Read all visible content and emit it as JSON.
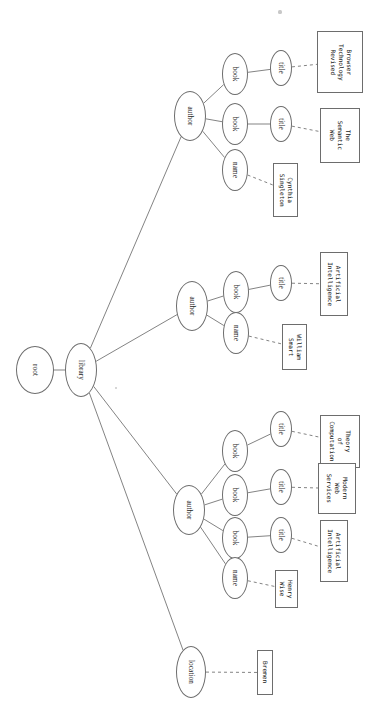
{
  "diagram": {
    "orientation": "rotated-90",
    "edge_color": "#6d6d6d",
    "node_fill": "#ffffff",
    "nodes": [
      {
        "id": "root",
        "label": "root",
        "cx": 35,
        "cy": 370,
        "rx": 19,
        "ry": 24
      },
      {
        "id": "library",
        "label": "library",
        "cx": 81,
        "cy": 370,
        "rx": 16,
        "ry": 27
      },
      {
        "id": "author1",
        "label": "author",
        "cx": 190,
        "cy": 116,
        "rx": 16,
        "ry": 25
      },
      {
        "id": "book1a",
        "label": "book",
        "cx": 235,
        "cy": 74,
        "rx": 13,
        "ry": 21
      },
      {
        "id": "title1a",
        "label": "title",
        "cx": 281,
        "cy": 68,
        "rx": 11,
        "ry": 18
      },
      {
        "id": "book1b",
        "label": "book",
        "cx": 235,
        "cy": 124,
        "rx": 13,
        "ry": 21
      },
      {
        "id": "title1b",
        "label": "title",
        "cx": 281,
        "cy": 124,
        "rx": 11,
        "ry": 18
      },
      {
        "id": "name1",
        "label": "name",
        "cx": 235,
        "cy": 170,
        "rx": 13,
        "ry": 21
      },
      {
        "id": "author2",
        "label": "author",
        "cx": 192,
        "cy": 306,
        "rx": 16,
        "ry": 25
      },
      {
        "id": "book2a",
        "label": "book",
        "cx": 236,
        "cy": 292,
        "rx": 13,
        "ry": 21
      },
      {
        "id": "title2a",
        "label": "title",
        "cx": 281,
        "cy": 283,
        "rx": 11,
        "ry": 18
      },
      {
        "id": "name2",
        "label": "name",
        "cx": 236,
        "cy": 333,
        "rx": 13,
        "ry": 21
      },
      {
        "id": "author3",
        "label": "author",
        "cx": 189,
        "cy": 510,
        "rx": 16,
        "ry": 25
      },
      {
        "id": "book3a",
        "label": "book",
        "cx": 235,
        "cy": 451,
        "rx": 13,
        "ry": 21
      },
      {
        "id": "title3a",
        "label": "title",
        "cx": 281,
        "cy": 429,
        "rx": 11,
        "ry": 18
      },
      {
        "id": "book3b",
        "label": "book",
        "cx": 235,
        "cy": 495,
        "rx": 13,
        "ry": 21
      },
      {
        "id": "title3b",
        "label": "title",
        "cx": 281,
        "cy": 487,
        "rx": 11,
        "ry": 18
      },
      {
        "id": "book3c",
        "label": "book",
        "cx": 235,
        "cy": 538,
        "rx": 13,
        "ry": 21
      },
      {
        "id": "title3c",
        "label": "title",
        "cx": 281,
        "cy": 535,
        "rx": 11,
        "ry": 18
      },
      {
        "id": "name3",
        "label": "name",
        "cx": 235,
        "cy": 578,
        "rx": 13,
        "ry": 21
      },
      {
        "id": "location",
        "label": "location",
        "cx": 191,
        "cy": 672,
        "rx": 15,
        "ry": 26
      }
    ],
    "leaves": [
      {
        "id": "leaf-browser-technology-revised",
        "text": "Browser\nTechnology\nRevised",
        "x": 317,
        "y": 31,
        "w": 46,
        "h": 62
      },
      {
        "id": "leaf-the-semantic-web",
        "text": "The\nSemantic\nWeb",
        "x": 320,
        "y": 108,
        "w": 40,
        "h": 55
      },
      {
        "id": "leaf-cynthia-singleton",
        "text": "Cynthia\nSingleton",
        "x": 273,
        "y": 163,
        "w": 25,
        "h": 54
      },
      {
        "id": "leaf-artificial-intelligence-1",
        "text": "Artificial\nIntelligence",
        "x": 320,
        "y": 252,
        "w": 28,
        "h": 64
      },
      {
        "id": "leaf-william-smart",
        "text": "William\nSmart",
        "x": 282,
        "y": 324,
        "w": 25,
        "h": 46
      },
      {
        "id": "leaf-theory-of-computation",
        "text": "Theory\nof\nComputation",
        "x": 320,
        "y": 415,
        "w": 40,
        "h": 53
      },
      {
        "id": "leaf-modern-web-services",
        "text": "Modern\nWeb\nServices",
        "x": 318,
        "y": 463,
        "w": 38,
        "h": 51
      },
      {
        "id": "leaf-artificial-intelligence-2",
        "text": "Artificial\nIntelligence",
        "x": 320,
        "y": 520,
        "w": 28,
        "h": 62
      },
      {
        "id": "leaf-henry-wise",
        "text": "Henry\nWise",
        "x": 275,
        "y": 570,
        "w": 23,
        "h": 38
      },
      {
        "id": "leaf-bremen",
        "text": "Bremen",
        "x": 257,
        "y": 650,
        "w": 16,
        "h": 45
      }
    ],
    "edges_solid": [
      {
        "from": "root",
        "to": "library"
      },
      {
        "from": "library",
        "to": "author1"
      },
      {
        "from": "library",
        "to": "author2"
      },
      {
        "from": "library",
        "to": "author3"
      },
      {
        "from": "library",
        "to": "location"
      },
      {
        "from": "author1",
        "to": "book1a"
      },
      {
        "from": "author1",
        "to": "book1b"
      },
      {
        "from": "author1",
        "to": "name1"
      },
      {
        "from": "book1a",
        "to": "title1a"
      },
      {
        "from": "book1b",
        "to": "title1b"
      },
      {
        "from": "author2",
        "to": "book2a"
      },
      {
        "from": "author2",
        "to": "name2"
      },
      {
        "from": "book2a",
        "to": "title2a"
      },
      {
        "from": "author3",
        "to": "book3a"
      },
      {
        "from": "author3",
        "to": "book3b"
      },
      {
        "from": "author3",
        "to": "book3c"
      },
      {
        "from": "author3",
        "to": "name3"
      },
      {
        "from": "book3a",
        "to": "title3a"
      },
      {
        "from": "book3b",
        "to": "title3b"
      },
      {
        "from": "book3c",
        "to": "title3c"
      }
    ],
    "edges_dashed": [
      {
        "from": "title1a",
        "to": "leaf-browser-technology-revised"
      },
      {
        "from": "title1b",
        "to": "leaf-the-semantic-web"
      },
      {
        "from": "name1",
        "to": "leaf-cynthia-singleton"
      },
      {
        "from": "title2a",
        "to": "leaf-artificial-intelligence-1"
      },
      {
        "from": "name2",
        "to": "leaf-william-smart"
      },
      {
        "from": "title3a",
        "to": "leaf-theory-of-computation"
      },
      {
        "from": "title3b",
        "to": "leaf-modern-web-services"
      },
      {
        "from": "title3c",
        "to": "leaf-artificial-intelligence-2"
      },
      {
        "from": "name3",
        "to": "leaf-henry-wise"
      },
      {
        "from": "location",
        "to": "leaf-bremen"
      }
    ],
    "specks": [
      {
        "x": 280,
        "y": 12,
        "r": 1.6
      },
      {
        "x": 116,
        "y": 388,
        "r": 1.2
      }
    ]
  }
}
